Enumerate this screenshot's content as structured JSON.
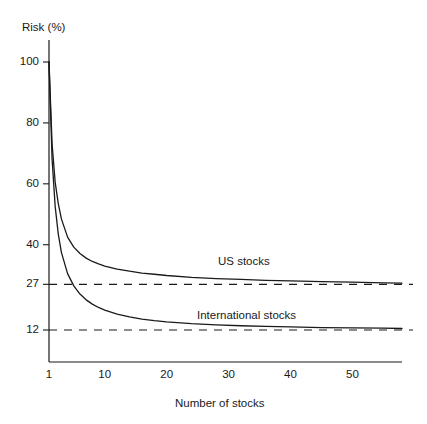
{
  "chart_data": {
    "type": "line",
    "title": "",
    "ylabel": "Risk (%)",
    "xlabel": "Number of stocks",
    "xlim": [
      1,
      58
    ],
    "ylim": [
      8,
      104
    ],
    "grid": false,
    "legend_position": "inline-annotations",
    "xticks": [
      1,
      10,
      20,
      30,
      40,
      50
    ],
    "xtick_labels": [
      "1",
      "10",
      "20",
      "30",
      "40",
      "50"
    ],
    "yticks": [
      12,
      27,
      40,
      60,
      80,
      100
    ],
    "ytick_labels": [
      "12",
      "27",
      "40",
      "60",
      "80",
      "100"
    ],
    "series": [
      {
        "name": "US stocks",
        "annotation": "US stocks",
        "asymptote": 27,
        "style": "solid",
        "color": "#1a1a1a",
        "x": [
          1,
          1.5,
          2,
          2.5,
          3,
          4,
          5,
          6,
          7,
          8,
          9,
          10,
          12,
          14,
          16,
          18,
          20,
          24,
          28,
          32,
          36,
          40,
          45,
          50,
          55,
          58
        ],
        "values": [
          100,
          73,
          60.5,
          53.5,
          48.5,
          42.5,
          39.2,
          37.1,
          35.6,
          34.5,
          33.7,
          33.0,
          32.0,
          31.3,
          30.7,
          30.3,
          29.9,
          29.3,
          28.9,
          28.6,
          28.3,
          28.1,
          27.9,
          27.7,
          27.5,
          27.4
        ]
      },
      {
        "name": "International stocks",
        "annotation": "International stocks",
        "asymptote": 12,
        "style": "solid",
        "color": "#1a1a1a",
        "x": [
          1,
          1.5,
          2,
          2.5,
          3,
          4,
          5,
          6,
          7,
          8,
          9,
          10,
          12,
          14,
          16,
          18,
          20,
          24,
          28,
          32,
          36,
          40,
          45,
          50,
          55,
          58
        ],
        "values": [
          100,
          68,
          52.5,
          43.5,
          37.5,
          30.5,
          26.5,
          23.8,
          21.9,
          20.5,
          19.4,
          18.5,
          17.2,
          16.3,
          15.6,
          15.1,
          14.7,
          14.1,
          13.7,
          13.4,
          13.2,
          13.0,
          12.8,
          12.7,
          12.6,
          12.5
        ]
      }
    ],
    "asymptote_lines": [
      {
        "name": "us-asymptote",
        "value": 27,
        "style": "dashed",
        "color": "#1a1a1a"
      },
      {
        "name": "international-asymptote",
        "value": 12,
        "style": "dashed",
        "color": "#1a1a1a"
      }
    ]
  },
  "axes": {
    "y_axis_title": "Risk (%)",
    "x_axis_title": "Number of stocks"
  },
  "ticks": {
    "y": [
      {
        "label": "100"
      },
      {
        "label": "80"
      },
      {
        "label": "60"
      },
      {
        "label": "40"
      },
      {
        "label": "27"
      },
      {
        "label": "12"
      }
    ],
    "x": [
      {
        "label": "1"
      },
      {
        "label": "10"
      },
      {
        "label": "20"
      },
      {
        "label": "30"
      },
      {
        "label": "40"
      },
      {
        "label": "50"
      }
    ]
  },
  "annotations": {
    "us": "US stocks",
    "international": "International stocks"
  }
}
